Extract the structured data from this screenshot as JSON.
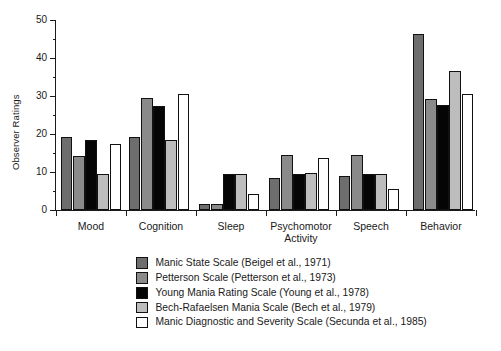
{
  "chart_data": {
    "type": "bar",
    "title": "",
    "subtitle": "",
    "xlabel": "",
    "ylabel": "Observer Ratings",
    "ylim": [
      0,
      50
    ],
    "yticks": [
      0,
      10,
      20,
      30,
      40,
      50
    ],
    "yticklabels": [
      "0",
      "10",
      "20",
      "30",
      "40",
      "50"
    ],
    "minor_yticks": [
      5,
      15,
      25,
      35,
      45
    ],
    "grid": false,
    "legend_position": "below-center",
    "categories": [
      "Mood",
      "Cognition",
      "Sleep",
      "Psychomotor Activity",
      "Speech",
      "Behavior"
    ],
    "category_labels": [
      [
        "Mood"
      ],
      [
        "Cognition"
      ],
      [
        "Sleep"
      ],
      [
        "Psychomotor",
        "Activity"
      ],
      [
        "Speech"
      ],
      [
        "Behavior"
      ]
    ],
    "series": [
      {
        "name": "Manic State Scale (Beigel et al., 1971)",
        "color": "#6e6e6e",
        "values": [
          19.1,
          19.2,
          1.5,
          8.4,
          8.8,
          46.1
        ]
      },
      {
        "name": "Petterson Scale (Petterson et al., 1973)",
        "color": "#8a8a8a",
        "values": [
          14.2,
          29.4,
          1.5,
          14.4,
          14.4,
          29.1
        ]
      },
      {
        "name": "Young Mania Rating Scale (Young et al., 1978)",
        "color": "#050505",
        "values": [
          18.2,
          27.2,
          9.3,
          9.4,
          9.4,
          27.5
        ]
      },
      {
        "name": "Bech-Rafaelsen Mania Scale (Bech et al., 1979)",
        "color": "#bdbdbd",
        "values": [
          9.4,
          18.2,
          9.3,
          9.6,
          9.4,
          36.4
        ]
      },
      {
        "name": "Manic Diagnostic and Severity Scale (Secunda et al., 1985)",
        "color": "#ffffff",
        "values": [
          17.3,
          30.3,
          4.3,
          13.5,
          5.5,
          30.5
        ]
      }
    ]
  },
  "legend": {
    "items": [
      {
        "label": "Manic State Scale (Beigel et al., 1971)",
        "swatch": "#6e6e6e"
      },
      {
        "label": "Petterson Scale (Petterson et al., 1973)",
        "swatch": "#8a8a8a"
      },
      {
        "label": "Young Mania Rating Scale (Young et al., 1978)",
        "swatch": "#050505"
      },
      {
        "label": "Bech-Rafaelsen Mania Scale (Bech et al., 1979)",
        "swatch": "#bdbdbd"
      },
      {
        "label": "Manic Diagnostic and Severity Scale (Secunda et al., 1985)",
        "swatch": "#ffffff"
      }
    ]
  }
}
